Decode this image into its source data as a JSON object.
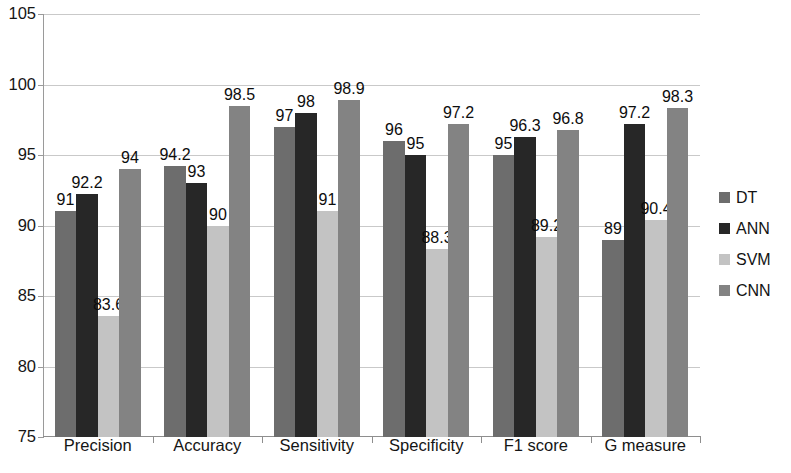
{
  "chart_data": {
    "type": "bar",
    "title": "",
    "xlabel": "",
    "ylabel": "",
    "ylim": [
      75,
      105
    ],
    "ytick_values": [
      75,
      80,
      85,
      90,
      95,
      100,
      105
    ],
    "ytick_labels": [
      "75",
      "80",
      "85",
      "90",
      "95",
      "100",
      "105"
    ],
    "grid": true,
    "legend_position": "right",
    "categories": [
      "Precision",
      "Accuracy",
      "Sensitivity",
      "Specificity",
      "F1 score",
      "G measure"
    ],
    "series": [
      {
        "name": "DT",
        "color": "#6d6d6d",
        "values": [
          91,
          94.2,
          97,
          96,
          95,
          89
        ],
        "labels": [
          "91",
          "94.2",
          "97",
          "96",
          "95",
          "89"
        ]
      },
      {
        "name": "ANN",
        "color": "#272727",
        "values": [
          92.2,
          93,
          98,
          95,
          96.3,
          97.2
        ],
        "labels": [
          "92.2",
          "93",
          "98",
          "95",
          "96.3",
          "97.2"
        ]
      },
      {
        "name": "SVM",
        "color": "#c3c3c3",
        "values": [
          83.6,
          90,
          91,
          88.3,
          89.2,
          90.4
        ],
        "labels": [
          "83.6",
          "90",
          "91",
          "88.3",
          "89.2",
          "90.4"
        ]
      },
      {
        "name": "CNN",
        "color": "#838383",
        "values": [
          94,
          98.5,
          98.9,
          97.2,
          96.8,
          98.3
        ],
        "labels": [
          "94",
          "98.5",
          "98.9",
          "97.2",
          "96.8",
          "98.3"
        ]
      }
    ]
  },
  "legend": {
    "items": [
      {
        "label": "DT"
      },
      {
        "label": "ANN"
      },
      {
        "label": "SVM"
      },
      {
        "label": "CNN"
      }
    ]
  }
}
